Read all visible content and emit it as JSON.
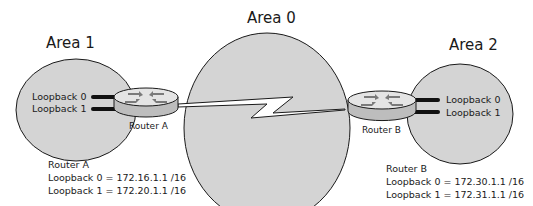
{
  "areas": [
    {
      "id": "area1",
      "label": "Area 1"
    },
    {
      "id": "area0",
      "label": "Area 0"
    },
    {
      "id": "area2",
      "label": "Area 2"
    }
  ],
  "routers": [
    {
      "id": "router-a",
      "label": "Router A",
      "loopbacks": [
        "Loopback 0",
        "Loopback 1"
      ]
    },
    {
      "id": "router-b",
      "label": "Router B",
      "loopbacks": [
        "Loopback 0",
        "Loopback 1"
      ]
    }
  ],
  "info": {
    "router_a": {
      "title": "Router A",
      "lines": [
        "Loopback 0 = 172.16.1.1 /16",
        "Loopback 1 = 172.20.1.1 /16"
      ]
    },
    "router_b": {
      "title": "Router B",
      "lines": [
        "Loopback 0 = 172.30.1.1 /16",
        "Loopback 1 = 172.31.1.1 /16"
      ]
    }
  },
  "link": {
    "type": "serial-wan-link",
    "between": [
      "Router A",
      "Router B"
    ]
  },
  "colors": {
    "area_fill": "#d4d4d4",
    "outline": "#1a1a1a",
    "router_fill": "#e2e2e2",
    "arrow": "#7a7a7a"
  }
}
